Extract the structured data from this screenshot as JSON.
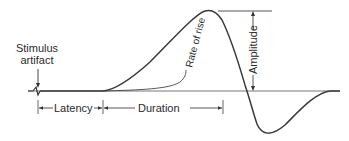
{
  "diagram": {
    "labels": {
      "stimulus_line1": "Stimulus",
      "stimulus_line2": "artifact",
      "latency": "Latency",
      "duration": "Duration",
      "rate_of_rise": "Rate of rise",
      "amplitude": "Amplitude"
    },
    "colors": {
      "trace": "#3a3a3a",
      "baseline": "#555555",
      "annotation": "#333333",
      "background": "#ffffff"
    }
  }
}
